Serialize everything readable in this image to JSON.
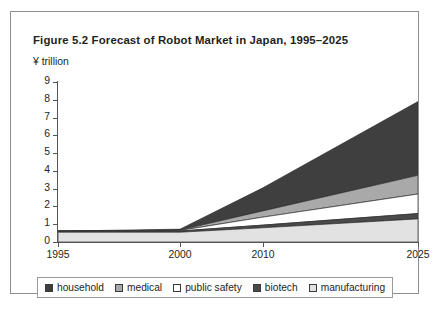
{
  "figure": {
    "title": "Figure 5.2  Forecast of Robot Market in Japan, 1995–2025",
    "unit_label": "¥ trillion"
  },
  "axes": {
    "y_ticks": [
      "9",
      "8",
      "7",
      "6",
      "5",
      "4",
      "3",
      "2",
      "1",
      "0"
    ],
    "x_ticks": [
      "1995",
      "2000",
      "2010",
      "2025"
    ]
  },
  "legend": {
    "items": [
      {
        "label": "household",
        "color": "#3f3f3f"
      },
      {
        "label": "medical",
        "color": "#a9a9a9"
      },
      {
        "label": "public safety",
        "color": "#ffffff"
      },
      {
        "label": "biotech",
        "color": "#4a4a4a"
      },
      {
        "label": "manufacturing",
        "color": "#e2e2e2"
      }
    ]
  },
  "chart_data": {
    "type": "area",
    "title": "Figure 5.2  Forecast of Robot Market in Japan, 1995–2025",
    "xlabel": "",
    "ylabel": "¥ trillion",
    "ylim": [
      0,
      9
    ],
    "grid": false,
    "legend_position": "bottom",
    "stacked": true,
    "x": [
      1995,
      2000,
      2010,
      2025
    ],
    "x_positions": [
      0,
      122,
      205,
      360
    ],
    "stack_order_bottom_to_top": [
      "manufacturing",
      "biotech",
      "public safety",
      "medical",
      "household"
    ],
    "series": [
      {
        "name": "manufacturing",
        "color": "#e2e2e2",
        "values": [
          0.55,
          0.55,
          0.8,
          1.3
        ]
      },
      {
        "name": "biotech",
        "color": "#4a4a4a",
        "values": [
          0.06,
          0.07,
          0.15,
          0.3
        ]
      },
      {
        "name": "public safety",
        "color": "#ffffff",
        "values": [
          0.0,
          0.03,
          0.45,
          1.1
        ]
      },
      {
        "name": "medical",
        "color": "#a9a9a9",
        "values": [
          0.0,
          0.02,
          0.35,
          1.05
        ]
      },
      {
        "name": "household",
        "color": "#3f3f3f",
        "values": [
          0.0,
          0.05,
          1.3,
          4.15
        ]
      }
    ],
    "totals": [
      0.61,
      0.72,
      3.05,
      7.9
    ]
  }
}
